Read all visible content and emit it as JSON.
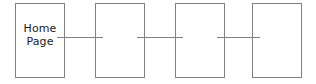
{
  "diagram": {
    "type": "flowchart",
    "orientation": "horizontal",
    "background_color": "#ffffff",
    "stroke_color": "#808080",
    "text_color": "#1a1a1a",
    "nodes": [
      {
        "id": "home-page",
        "label": "Home\nPage",
        "shape": "rectangle",
        "x": 15,
        "y": 3,
        "width": 50,
        "height": 75
      },
      {
        "id": "node-2",
        "label": "",
        "shape": "rectangle",
        "x": 95,
        "y": 3,
        "width": 50,
        "height": 75
      },
      {
        "id": "node-3",
        "label": "",
        "shape": "rectangle",
        "x": 175,
        "y": 3,
        "width": 50,
        "height": 75
      },
      {
        "id": "node-4",
        "label": "",
        "shape": "rectangle",
        "x": 252,
        "y": 3,
        "width": 50,
        "height": 75
      }
    ],
    "connectors": [
      {
        "id": "connector-1",
        "from": "home-page",
        "to": "node-2",
        "x": 57,
        "y": 37,
        "length": 46
      },
      {
        "id": "connector-2",
        "from": "node-2",
        "to": "node-3",
        "x": 137,
        "y": 37,
        "length": 46
      },
      {
        "id": "connector-3",
        "from": "node-3",
        "to": "node-4",
        "x": 217,
        "y": 37,
        "length": 43
      }
    ]
  }
}
